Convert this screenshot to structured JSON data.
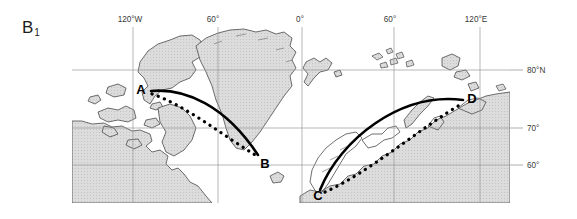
{
  "figure": {
    "panel_label": "B",
    "panel_subscript": "1",
    "caption_visible": false
  },
  "map": {
    "title": "",
    "projection_note": "polar-region map with graticule",
    "frame": {
      "x": 72,
      "y": 27,
      "width": 438,
      "height": 176
    },
    "colors": {
      "land_fill": "#d9d9d9",
      "coastline": "#4a4a4a",
      "graticule": "#9a9a9a",
      "route_solid": "#000000",
      "route_dotted": "#000000",
      "label_text": "#3a3a3a",
      "background": "#ffffff"
    },
    "longitude_labels": [
      {
        "text": "120°W",
        "x": 130,
        "tick_x": 133
      },
      {
        "text": "60°",
        "x": 213,
        "tick_x": 218
      },
      {
        "text": "0°",
        "x": 300,
        "tick_x": 302
      },
      {
        "text": "60°",
        "x": 390,
        "tick_x": 394
      },
      {
        "text": "120°E",
        "x": 476,
        "tick_x": 480
      }
    ],
    "latitude_labels": [
      {
        "text": "80°N",
        "y": 70
      },
      {
        "text": "70°",
        "y": 128
      },
      {
        "text": "60°",
        "y": 165
      }
    ],
    "points": [
      {
        "id": "A",
        "label": "A",
        "x": 148,
        "y": 92
      },
      {
        "id": "B",
        "label": "B",
        "x": 263,
        "y": 160
      },
      {
        "id": "C",
        "label": "C",
        "x": 322,
        "y": 192
      },
      {
        "id": "D",
        "label": "D",
        "x": 468,
        "y": 100
      }
    ],
    "routes": [
      {
        "id": "AB-great-circle",
        "style": "solid",
        "from": "A",
        "to": "B",
        "path": "M 151 91 C 185 88, 225 105, 258 155"
      },
      {
        "id": "AB-rhumb-line",
        "style": "dotted",
        "from": "A",
        "to": "B",
        "path": "M 152 94 C 185 105, 222 135, 257 156"
      },
      {
        "id": "CD-great-circle",
        "style": "solid",
        "from": "C",
        "to": "D",
        "path": "M 320 190 C 340 140, 400 92, 463 100"
      },
      {
        "id": "CD-rhumb-line",
        "style": "dotted",
        "from": "C",
        "to": "D",
        "path": "M 325 192 C 370 172, 420 128, 463 103"
      }
    ]
  }
}
